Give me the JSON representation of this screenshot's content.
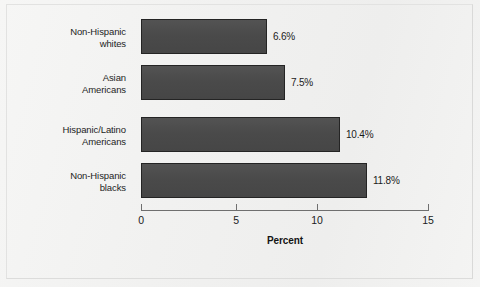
{
  "chart_data": {
    "type": "bar",
    "orientation": "horizontal",
    "title": "",
    "xlabel": "Percent",
    "ylabel": "",
    "xlim": [
      0,
      15
    ],
    "xticks": [
      0,
      5,
      10,
      15
    ],
    "xtick_labels": [
      "0",
      "5",
      "10",
      "15"
    ],
    "grid": false,
    "legend": null,
    "categories": [
      "Non-Hispanic\nwhites",
      "Asian\nAmericans",
      "Hispanic/Latino\nAmericans",
      "Non-Hispanic\nblacks"
    ],
    "values": [
      6.6,
      7.5,
      10.4,
      11.8
    ],
    "value_labels": [
      "6.6%",
      "7.5%",
      "10.4%",
      "11.8%"
    ],
    "colors": {
      "bar_fill": "#4c4c4c",
      "bar_border": "#242424",
      "axis": "#6f6f6f",
      "text": "#1b1b1b",
      "background": "#f2f2f1"
    }
  }
}
